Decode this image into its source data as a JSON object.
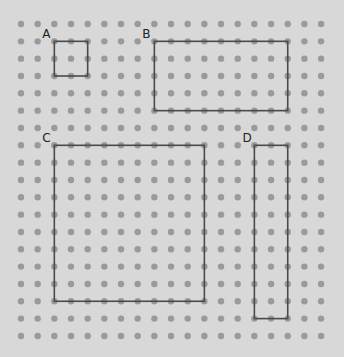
{
  "diagram": {
    "type": "dot-grid",
    "grid": {
      "columns": 19,
      "rows": 19
    },
    "colors": {
      "background": "#d8d8d8",
      "dot": "#9a9a9a",
      "outline": "#4a4a4a",
      "label": "#222222"
    },
    "shapes": [
      {
        "label": "A",
        "col_start": 2,
        "row_start": 1,
        "width_units": 2,
        "height_units": 2
      },
      {
        "label": "B",
        "col_start": 8,
        "row_start": 1,
        "width_units": 8,
        "height_units": 4
      },
      {
        "label": "C",
        "col_start": 2,
        "row_start": 7,
        "width_units": 9,
        "height_units": 9
      },
      {
        "label": "D",
        "col_start": 14,
        "row_start": 7,
        "width_units": 2,
        "height_units": 10
      }
    ]
  }
}
